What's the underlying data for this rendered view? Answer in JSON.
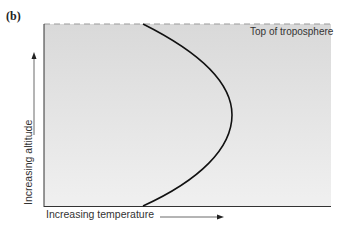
{
  "panel_label": "(b)",
  "diagram": {
    "top_boundary_label": "Top of troposphere",
    "x_axis_label": "Increasing temperature",
    "y_axis_label": "Increasing altitude",
    "colors": {
      "background_top": "#d8d8d8",
      "background_bottom": "#f0f0f0",
      "curve": "#111111",
      "axis": "#333333",
      "dashed_line": "#999999"
    },
    "curve_description": "Temperature profile bulging to the right: low at bottom and top of troposphere, maximum at mid-altitude"
  }
}
